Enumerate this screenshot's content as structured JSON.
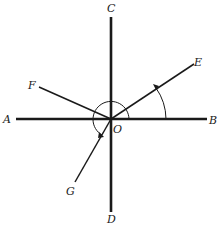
{
  "diagram": {
    "title": "",
    "center": {
      "label": "O",
      "x": 111,
      "y": 119
    },
    "colors": {
      "ink": "#1a1a1a",
      "background": "#ffffff"
    },
    "labels": {
      "A": "A",
      "B": "B",
      "C": "C",
      "D": "D",
      "E": "E",
      "F": "F",
      "G": "G",
      "O": "O"
    },
    "lines": [
      {
        "name": "OA",
        "from": "O",
        "to": "A",
        "thick": true
      },
      {
        "name": "OB",
        "from": "O",
        "to": "B",
        "thick": true
      },
      {
        "name": "OC",
        "from": "O",
        "to": "C",
        "thick": true
      },
      {
        "name": "OD",
        "from": "O",
        "to": "D",
        "thick": true
      },
      {
        "name": "OE",
        "from": "O",
        "to": "E",
        "thick": false
      },
      {
        "name": "OF",
        "from": "O",
        "to": "F",
        "thick": false
      },
      {
        "name": "OG",
        "from": "O",
        "to": "G",
        "thick": false
      }
    ],
    "arcs": [
      {
        "name": "angle-BOE",
        "from": "B",
        "to": "E",
        "direction": "counterclockwise",
        "arrow": true
      },
      {
        "name": "angle-BOG-reflex",
        "from": "B",
        "to": "G",
        "direction": "counterclockwise",
        "arrow": true
      }
    ]
  }
}
